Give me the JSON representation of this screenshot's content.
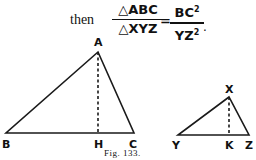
{
  "equation": {
    "prefix": "then",
    "lhs_numerator": "△ABC",
    "lhs_denominator": "△XYZ",
    "equals": "=",
    "rhs_numerator": "BC",
    "rhs_denominator": "YZ",
    "exponent": "2",
    "terminator": "."
  },
  "figure": {
    "caption": "Fig. 133.",
    "triangle1": {
      "labels": {
        "A": "A",
        "B": "B",
        "C": "C",
        "H": "H"
      },
      "points": {
        "A": [
          98,
          52
        ],
        "B": [
          6,
          133
        ],
        "C": [
          134,
          133
        ],
        "H": [
          98,
          133
        ]
      }
    },
    "triangle2": {
      "labels": {
        "X": "X",
        "Y": "Y",
        "Z": "Z",
        "K": "K"
      },
      "points": {
        "X": [
          229,
          97
        ],
        "Y": [
          178,
          135
        ],
        "Z": [
          249,
          135
        ],
        "K": [
          229,
          135
        ]
      }
    },
    "line_color": "#1a1a1a"
  }
}
